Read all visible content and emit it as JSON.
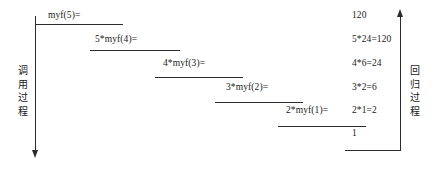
{
  "diagram": {
    "left_axis": {
      "caption": "调用过程",
      "direction": "down"
    },
    "right_axis": {
      "caption": "回归过程",
      "direction": "up"
    },
    "call_steps": [
      {
        "label": "myf(5)=",
        "label_x": 48,
        "label_y": 10,
        "line_x": 35,
        "line_y": 24,
        "line_w": 88
      },
      {
        "label": "5*myf(4)=",
        "label_x": 95,
        "label_y": 34,
        "line_x": 90,
        "line_y": 50,
        "line_w": 90
      },
      {
        "label": "4*myf(3)=",
        "label_x": 163,
        "label_y": 58,
        "line_x": 155,
        "line_y": 77,
        "line_w": 88
      },
      {
        "label": "3*myf(2)=",
        "label_x": 226,
        "label_y": 82,
        "line_x": 215,
        "line_y": 102,
        "line_w": 88
      },
      {
        "label": "2*myf(1)=",
        "label_x": 286,
        "label_y": 105,
        "line_x": 278,
        "line_y": 126,
        "line_w": 88
      }
    ],
    "return_values": [
      {
        "label": "120",
        "label_x": 352,
        "label_y": 10
      },
      {
        "label": "5*24=120",
        "label_x": 352,
        "label_y": 34
      },
      {
        "label": "4*6=24",
        "label_x": 352,
        "label_y": 58
      },
      {
        "label": "3*2=6",
        "label_x": 352,
        "label_y": 82
      },
      {
        "label": "2*1=2",
        "label_x": 352,
        "label_y": 105
      },
      {
        "label": "1",
        "label_x": 352,
        "label_y": 128
      }
    ],
    "bottom_line": {
      "line_x": 345,
      "line_y": 150,
      "line_w": 55
    },
    "colors": {
      "ink": "#2b2b2b",
      "text": "#1a1a1a",
      "background": "#ffffff"
    }
  }
}
